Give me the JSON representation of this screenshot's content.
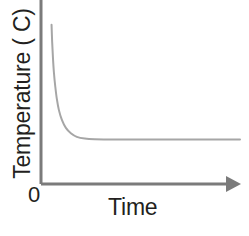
{
  "chart_data": {
    "type": "line",
    "title": "",
    "subtitle": "",
    "xlabel": "Time",
    "ylabel": "Temperature ( C)",
    "origin_label": "0",
    "xlim": [
      0,
      100
    ],
    "ylim": [
      0,
      100
    ],
    "grid": false,
    "legend": null,
    "axis_ticks": {
      "x": [],
      "y": []
    },
    "axis_arrow": {
      "x": true,
      "y": false
    },
    "series": [
      {
        "name": "Temperature decay",
        "description": "Exponential decay curve falling steeply from a high initial temperature then levelling off to a constant plateau",
        "points": [
          {
            "x": 5.3,
            "y": 89.5
          },
          {
            "x": 5.6,
            "y": 80.0
          },
          {
            "x": 6.0,
            "y": 71.0
          },
          {
            "x": 6.5,
            "y": 62.5
          },
          {
            "x": 7.2,
            "y": 54.5
          },
          {
            "x": 8.0,
            "y": 47.5
          },
          {
            "x": 9.0,
            "y": 41.5
          },
          {
            "x": 10.5,
            "y": 36.0
          },
          {
            "x": 12.5,
            "y": 31.5
          },
          {
            "x": 15.0,
            "y": 28.5
          },
          {
            "x": 18.0,
            "y": 26.5
          },
          {
            "x": 22.0,
            "y": 25.5
          },
          {
            "x": 27.0,
            "y": 25.1
          },
          {
            "x": 35.0,
            "y": 25.0
          },
          {
            "x": 50.0,
            "y": 25.0
          },
          {
            "x": 70.0,
            "y": 25.0
          },
          {
            "x": 90.0,
            "y": 25.0
          },
          {
            "x": 100.0,
            "y": 25.0
          }
        ]
      }
    ]
  },
  "style": {
    "axis_color": "#7b7b7b",
    "curve_color": "#a6a6a6",
    "text_color": "#231f20",
    "background": "#ffffff"
  }
}
